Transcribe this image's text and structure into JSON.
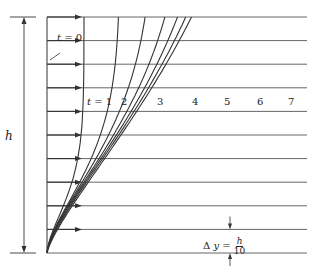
{
  "diagram": {
    "labels": {
      "t0": "t = 0",
      "t_labels": [
        "t = 1",
        "2",
        "3",
        "4",
        "5",
        "6",
        "7"
      ],
      "height": "h",
      "dy_lhs": "Δ y =",
      "dy_num": "h",
      "dy_den": "10"
    },
    "grid": {
      "x_left": 47,
      "x_right": 307,
      "y_top": 17,
      "y_bottom": 253,
      "intervals": 10
    },
    "curve_top_x": [
      84,
      120,
      155,
      192,
      228,
      263,
      297
    ],
    "colors": {
      "line": "#555555",
      "curve": "#333333",
      "text": "#222222",
      "background": "#ffffff"
    }
  }
}
